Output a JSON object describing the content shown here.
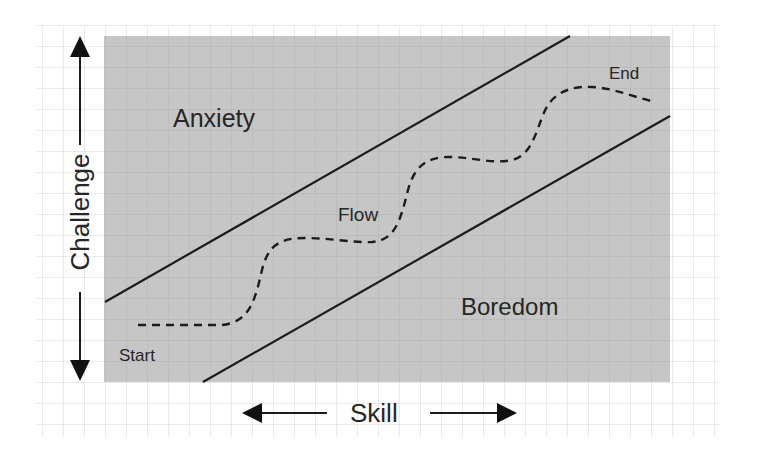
{
  "diagram": {
    "title": "",
    "type": "flow-channel",
    "axes": {
      "vertical_label": "Challenge",
      "horizontal_label": "Skill"
    },
    "regions": {
      "upper": "Anxiety",
      "middle": "Flow",
      "lower": "Boredom"
    },
    "path": {
      "start_label": "Start",
      "end_label": "End",
      "style": "dashed"
    },
    "colors": {
      "background": "#ffffff",
      "grid_line": "#d4d4d4",
      "shaded_area": "#c6c6c6",
      "shaded_grid_line": "#b4b4b4",
      "line": "#1c1c1c",
      "text": "#262626"
    }
  }
}
